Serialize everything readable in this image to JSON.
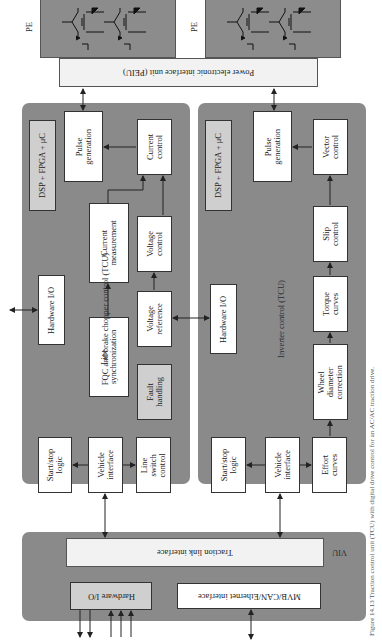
{
  "colors": {
    "panel": "#8a8a8a",
    "box": "#ffffff",
    "highlight_box": "#cfcfcf",
    "interface_bar": "#f2f2f2",
    "line": "#222222"
  },
  "power_electronics": {
    "left": {
      "label": "PE"
    },
    "right": {
      "label": "PE"
    }
  },
  "peiu": {
    "label": "Power electronic interface unit (PEIU)"
  },
  "fqc_tcu": {
    "title": "FQC and brake chopper control (TCU)",
    "processor": "DSP + FPGA + μC",
    "hardware_io": "Hardware I/O",
    "blocks": {
      "pulse_generation": "Pulse generation",
      "current_control": "Current control",
      "current_measurement": "Current measurement",
      "voltage_control": "Voltage control",
      "line_synchronization": "Line synchronization",
      "voltage_reference": "Voltage reference",
      "fault_handling": "Fault handling",
      "start_stop_logic": "Start/stop logic",
      "vehicle_interface": "Vehicle interface",
      "line_switch_control": "Line switch control"
    }
  },
  "inverter_tcu": {
    "title": "Inverter control (TCU)",
    "processor": "DSP + FPGA + μC",
    "hardware_io": "Hardware I/O",
    "blocks": {
      "pulse_generation": "Pulse generation",
      "vector_control": "Vector control",
      "slip_control": "Slip control",
      "torque_curves": "Torque curves",
      "wheel_diameter_correction": "Wheel diameter correction",
      "start_stop_logic": "Start/stop logic",
      "vehicle_interface": "Vehicle interface",
      "effort_curves": "Effort curves"
    }
  },
  "viu": {
    "label": "VIU",
    "traction_link_interface": "Traction link interface",
    "hardware_io": "Hardware I/O",
    "bus_interface": "MVB/CAN/Ethernet interface"
  },
  "caption": "Figure 14.13  Traction control unit (TCU) with digital drive control for an AC/AC traction drive."
}
